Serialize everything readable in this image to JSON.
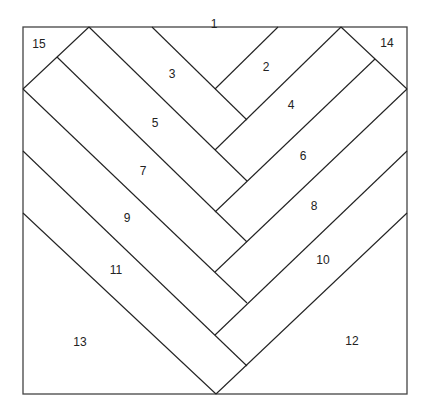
{
  "diagram": {
    "type": "herringbone-quilt-block",
    "colors": {
      "line": "#222222",
      "frame": "#444444",
      "background": "#ffffff"
    },
    "frame": {
      "x1": 23,
      "y1": 27,
      "x2": 407,
      "y2": 394
    },
    "lines": [
      {
        "id": "corner-15-seam",
        "x1": 89,
        "y1": 27,
        "x2": 23,
        "y2": 89
      },
      {
        "id": "corner-14-seam",
        "x1": 341,
        "y1": 27,
        "x2": 407,
        "y2": 89
      },
      {
        "id": "d1",
        "x1": 152,
        "y1": 27,
        "x2": 247,
        "y2": 120
      },
      {
        "id": "d2",
        "x1": 89,
        "y1": 27,
        "x2": 247,
        "y2": 181
      },
      {
        "id": "d3",
        "x1": 57,
        "y1": 57,
        "x2": 247,
        "y2": 242
      },
      {
        "id": "d4",
        "x1": 23,
        "y1": 89,
        "x2": 247,
        "y2": 303
      },
      {
        "id": "d5",
        "x1": 23,
        "y1": 151,
        "x2": 247,
        "y2": 366
      },
      {
        "id": "d6",
        "x1": 23,
        "y1": 213,
        "x2": 216,
        "y2": 394
      },
      {
        "id": "u1",
        "x1": 278,
        "y1": 27,
        "x2": 215,
        "y2": 89
      },
      {
        "id": "u2",
        "x1": 341,
        "y1": 27,
        "x2": 215,
        "y2": 150
      },
      {
        "id": "u3",
        "x1": 375,
        "y1": 59,
        "x2": 215,
        "y2": 212
      },
      {
        "id": "u4",
        "x1": 407,
        "y1": 89,
        "x2": 215,
        "y2": 272
      },
      {
        "id": "u5",
        "x1": 407,
        "y1": 151,
        "x2": 215,
        "y2": 335
      },
      {
        "id": "u6",
        "x1": 407,
        "y1": 213,
        "x2": 216,
        "y2": 394
      }
    ],
    "labels": [
      {
        "text": "1",
        "x": 214,
        "y": 25
      },
      {
        "text": "2",
        "x": 266,
        "y": 68
      },
      {
        "text": "3",
        "x": 172,
        "y": 75
      },
      {
        "text": "4",
        "x": 291,
        "y": 106
      },
      {
        "text": "5",
        "x": 155,
        "y": 124
      },
      {
        "text": "6",
        "x": 303,
        "y": 157
      },
      {
        "text": "7",
        "x": 143,
        "y": 172
      },
      {
        "text": "8",
        "x": 314,
        "y": 207
      },
      {
        "text": "9",
        "x": 127,
        "y": 219
      },
      {
        "text": "10",
        "x": 323,
        "y": 261
      },
      {
        "text": "11",
        "x": 116,
        "y": 271
      },
      {
        "text": "12",
        "x": 352,
        "y": 342
      },
      {
        "text": "13",
        "x": 80,
        "y": 343
      },
      {
        "text": "14",
        "x": 387,
        "y": 44
      },
      {
        "text": "15",
        "x": 39,
        "y": 45
      }
    ]
  }
}
